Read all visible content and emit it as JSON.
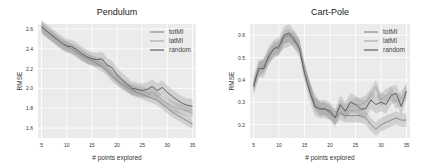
{
  "chart_data": [
    {
      "type": "line",
      "title": "Pendulum",
      "xlabel": "# points explored",
      "ylabel": "RMSE",
      "xlim": [
        4.3,
        35.7
      ],
      "ylim": [
        1.5,
        2.65
      ],
      "xticks": [
        5,
        10,
        15,
        20,
        25,
        30,
        35
      ],
      "yticks": [
        1.6,
        1.8,
        2.0,
        2.2,
        2.4,
        2.6
      ],
      "xtick_labels": [
        "5",
        "10",
        "15",
        "20",
        "25",
        "30",
        "35"
      ],
      "ytick_labels": [
        "1.6",
        "1.8",
        "2.0",
        "2.2",
        "2.4",
        "2.6"
      ],
      "grid": true,
      "legend_position": "top-right",
      "x": [
        5,
        6,
        7,
        8,
        9,
        10,
        11,
        12,
        13,
        14,
        15,
        16,
        17,
        18,
        19,
        20,
        21,
        22,
        23,
        24,
        25,
        26,
        27,
        28,
        29,
        30,
        31,
        32,
        33,
        34,
        35
      ],
      "series": [
        {
          "name": "totMI",
          "values": [
            2.62,
            2.57,
            2.53,
            2.49,
            2.45,
            2.42,
            2.4,
            2.36,
            2.33,
            2.3,
            2.28,
            2.25,
            2.22,
            2.18,
            2.12,
            2.08,
            2.04,
            2.01,
            1.98,
            1.96,
            1.94,
            1.92,
            1.9,
            1.88,
            1.84,
            1.8,
            1.76,
            1.73,
            1.7,
            1.67,
            1.64
          ],
          "band": 0.05
        },
        {
          "name": "latMI",
          "values": [
            2.62,
            2.57,
            2.53,
            2.49,
            2.45,
            2.43,
            2.4,
            2.38,
            2.35,
            2.31,
            2.29,
            2.27,
            2.25,
            2.2,
            2.14,
            2.1,
            2.05,
            2.02,
            1.99,
            1.98,
            1.97,
            1.95,
            1.96,
            1.93,
            1.88,
            1.85,
            1.82,
            1.8,
            1.79,
            1.77,
            1.75
          ],
          "band": 0.05
        },
        {
          "name": "random",
          "values": [
            2.62,
            2.58,
            2.54,
            2.5,
            2.46,
            2.43,
            2.42,
            2.39,
            2.35,
            2.32,
            2.3,
            2.29,
            2.3,
            2.24,
            2.21,
            2.14,
            2.09,
            2.04,
            2.0,
            1.99,
            1.98,
            1.99,
            2.02,
            1.98,
            2.01,
            1.96,
            1.92,
            1.88,
            1.85,
            1.83,
            1.82
          ],
          "band": 0.07
        }
      ]
    },
    {
      "type": "line",
      "title": "Cart-Pole",
      "xlabel": "# points explored",
      "ylabel": "RMSE",
      "xlim": [
        4.3,
        35.7
      ],
      "ylim": [
        0.14,
        0.65
      ],
      "xticks": [
        5,
        10,
        15,
        20,
        25,
        30,
        35
      ],
      "yticks": [
        0.2,
        0.3,
        0.4,
        0.5,
        0.6
      ],
      "xtick_labels": [
        "5",
        "10",
        "15",
        "20",
        "25",
        "30",
        "35"
      ],
      "ytick_labels": [
        "0.2",
        "0.3",
        "0.4",
        "0.5",
        "0.6"
      ],
      "grid": true,
      "legend_position": "top-right",
      "x": [
        5,
        6,
        7,
        8,
        9,
        10,
        11,
        12,
        13,
        14,
        15,
        16,
        17,
        18,
        19,
        20,
        21,
        22,
        23,
        24,
        25,
        26,
        27,
        28,
        29,
        30,
        31,
        32,
        33,
        34,
        35
      ],
      "series": [
        {
          "name": "totMI",
          "values": [
            0.38,
            0.45,
            0.46,
            0.5,
            0.54,
            0.54,
            0.59,
            0.6,
            0.57,
            0.55,
            0.45,
            0.37,
            0.29,
            0.27,
            0.27,
            0.25,
            0.23,
            0.25,
            0.24,
            0.24,
            0.24,
            0.24,
            0.23,
            0.2,
            0.18,
            0.2,
            0.21,
            0.22,
            0.23,
            0.22,
            0.22
          ],
          "band": 0.03
        },
        {
          "name": "latMI",
          "values": [
            0.37,
            0.44,
            0.47,
            0.51,
            0.53,
            0.55,
            0.57,
            0.58,
            0.59,
            0.55,
            0.44,
            0.36,
            0.31,
            0.27,
            0.27,
            0.26,
            0.23,
            0.28,
            0.26,
            0.28,
            0.29,
            0.29,
            0.3,
            0.33,
            0.37,
            0.31,
            0.33,
            0.34,
            0.3,
            0.32,
            0.35
          ],
          "band": 0.03
        },
        {
          "name": "random",
          "values": [
            0.37,
            0.45,
            0.45,
            0.51,
            0.54,
            0.55,
            0.6,
            0.61,
            0.58,
            0.54,
            0.43,
            0.35,
            0.28,
            0.27,
            0.27,
            0.26,
            0.23,
            0.29,
            0.26,
            0.3,
            0.29,
            0.27,
            0.27,
            0.31,
            0.29,
            0.3,
            0.29,
            0.33,
            0.34,
            0.28,
            0.35
          ],
          "band": 0.04
        }
      ]
    }
  ],
  "style": {
    "plot_background": "#ebebeb",
    "grid_color": "#ffffff",
    "series_colors": {
      "totMI": "#8a8a8a",
      "latMI": "#a9a9a9",
      "random": "#5f5f5f"
    },
    "band_color": "#9a9a9a"
  }
}
